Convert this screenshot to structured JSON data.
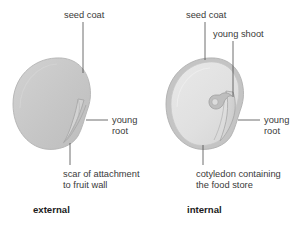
{
  "figure": {
    "background_color": "#ffffff",
    "text_color": "#3a3a3a",
    "caption_color": "#1c1c1c",
    "leader_color": "#4a4a4a"
  },
  "palette": {
    "seed_coat_fill": "#c9c9c9",
    "seed_coat_stroke": "#b0b0b0",
    "seed_coat_ring": "#bdbdbd",
    "cotyledon_fill": "#e2e2e2",
    "cotyledon_stroke": "#c8c8c8",
    "young_root_fill": "#d8d8d8",
    "young_root_stroke": "#a8a8a8",
    "young_shoot_fill": "#bcbcbc",
    "young_shoot_stroke": "#9e9e9e"
  },
  "panels": [
    {
      "id": "external",
      "caption": "external",
      "labels": {
        "seed_coat": "seed coat",
        "young_root_line1": "young",
        "young_root_line2": "root",
        "scar_line1": "scar of attachment",
        "scar_line2": "to fruit wall"
      }
    },
    {
      "id": "internal",
      "caption": "internal",
      "labels": {
        "seed_coat": "seed coat",
        "young_shoot": "young shoot",
        "young_root_line1": "young",
        "young_root_line2": "root",
        "cotyledon_line1": "cotyledon containing",
        "cotyledon_line2": "the food store"
      }
    }
  ]
}
